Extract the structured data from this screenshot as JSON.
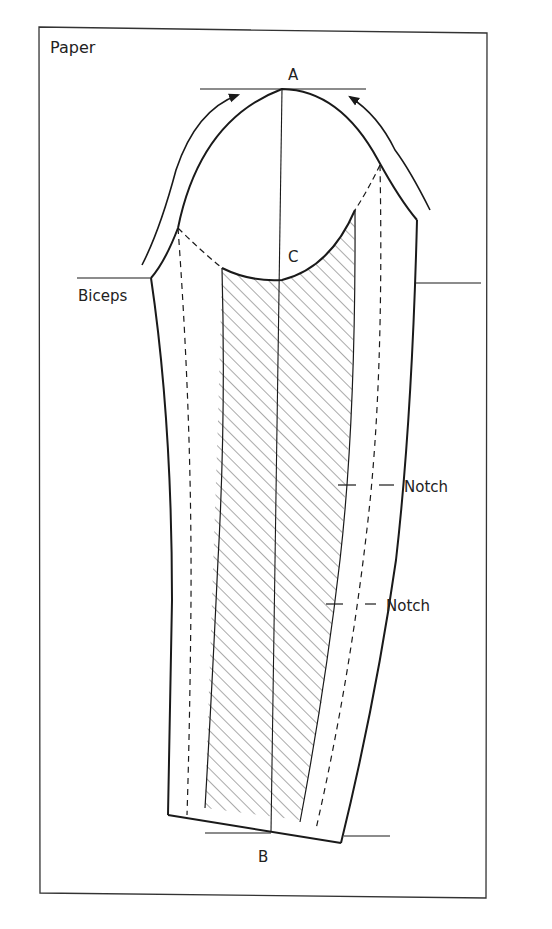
{
  "diagram": {
    "type": "sleeve pattern drafting diagram",
    "paper_label": "Paper",
    "points": {
      "A": "A",
      "B": "B",
      "C": "C"
    },
    "labels": {
      "biceps": "Biceps",
      "notch_upper": "Notch",
      "notch_lower": "Notch"
    },
    "colors": {
      "line": "#1a1a1a",
      "hatch": "#555555",
      "paper_border": "#333333",
      "background": "#ffffff"
    }
  }
}
